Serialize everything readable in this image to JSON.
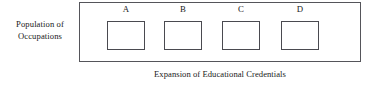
{
  "figure": {
    "type": "conceptual-diagram",
    "vertical_axis_label": {
      "line1": "Population of",
      "line2": "Occupations"
    },
    "horizontal_axis_label": "Expansion of Educational Credentials",
    "columns": [
      {
        "caption": "A"
      },
      {
        "caption": "B"
      },
      {
        "caption": "C"
      },
      {
        "caption": "D"
      }
    ],
    "colors": {
      "outer_frame_stroke": "#55555a",
      "box_stroke": "#4a4a50",
      "background": "#ffffff",
      "text": "#1a1a1a"
    },
    "arrow": {
      "direction": "double-headed-horizontal",
      "left_head": "◄",
      "right_head": "►"
    }
  }
}
